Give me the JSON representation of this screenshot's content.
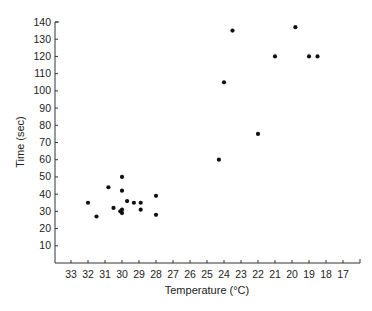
{
  "chart_data": {
    "type": "scatter",
    "title": "",
    "xlabel": "Temperature (°C)",
    "ylabel": "Time (sec)",
    "x_ticks": [
      33,
      32,
      31,
      30,
      29,
      28,
      27,
      26,
      25,
      24,
      23,
      22,
      21,
      20,
      19,
      18,
      17
    ],
    "y_ticks": [
      10,
      20,
      30,
      40,
      50,
      60,
      70,
      80,
      90,
      100,
      110,
      120,
      130,
      140
    ],
    "xlim": [
      34,
      16
    ],
    "ylim": [
      0,
      140
    ],
    "x_reversed": true,
    "grid": false,
    "legend": null,
    "marker_color": "#111111",
    "points": [
      {
        "x": 32,
        "y": 35
      },
      {
        "x": 31.5,
        "y": 27
      },
      {
        "x": 30.8,
        "y": 44
      },
      {
        "x": 30,
        "y": 50
      },
      {
        "x": 30,
        "y": 42
      },
      {
        "x": 30.5,
        "y": 32
      },
      {
        "x": 29.7,
        "y": 36
      },
      {
        "x": 30,
        "y": 31
      },
      {
        "x": 30.1,
        "y": 30
      },
      {
        "x": 30,
        "y": 29
      },
      {
        "x": 29.3,
        "y": 35
      },
      {
        "x": 28.9,
        "y": 35
      },
      {
        "x": 28.9,
        "y": 31
      },
      {
        "x": 28,
        "y": 39
      },
      {
        "x": 28,
        "y": 28
      },
      {
        "x": 24.3,
        "y": 60
      },
      {
        "x": 24,
        "y": 105
      },
      {
        "x": 23.5,
        "y": 135
      },
      {
        "x": 22,
        "y": 75
      },
      {
        "x": 21,
        "y": 120
      },
      {
        "x": 19.8,
        "y": 137
      },
      {
        "x": 19,
        "y": 120
      },
      {
        "x": 18.5,
        "y": 120
      }
    ]
  }
}
